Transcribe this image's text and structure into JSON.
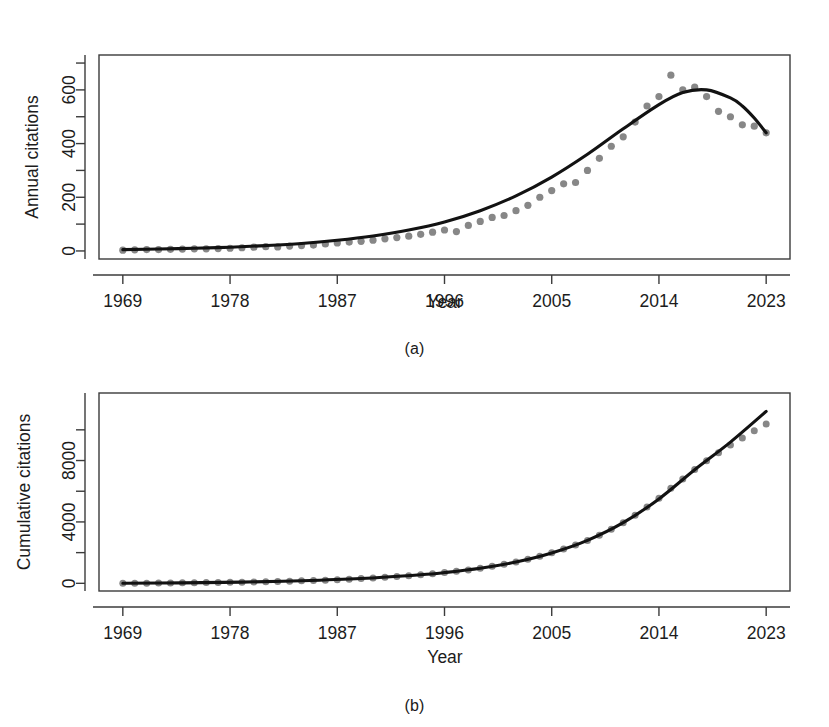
{
  "figure": {
    "panels": [
      {
        "id": "a",
        "caption": "(a)",
        "xlabel": "Year",
        "ylabel": "Annual citations"
      },
      {
        "id": "b",
        "caption": "(b)",
        "xlabel": "Year",
        "ylabel": "Cumulative citations"
      }
    ]
  },
  "chart_data": [
    {
      "type": "scatter",
      "panel": "a",
      "title": "",
      "xlabel": "Year",
      "ylabel": "Annual citations",
      "xlim": [
        1967,
        2025
      ],
      "ylim": [
        -30,
        730
      ],
      "xticks": [
        1969,
        1978,
        1987,
        1996,
        2005,
        2014,
        2023
      ],
      "xtick_labels": [
        "1969",
        "1978",
        "1987",
        "1996",
        "2005",
        "2014",
        "2023"
      ],
      "yticks": [
        0,
        200,
        400,
        600
      ],
      "ytick_labels": [
        "0",
        "200",
        "400",
        "600"
      ],
      "yminor_ticks": [
        100,
        300,
        500,
        700
      ],
      "grid": false,
      "legend": "none",
      "series": [
        {
          "name": "Observed annual citations",
          "style": "points",
          "color": "#878787",
          "x": [
            1969,
            1970,
            1971,
            1972,
            1973,
            1974,
            1975,
            1976,
            1977,
            1978,
            1979,
            1980,
            1981,
            1982,
            1983,
            1984,
            1985,
            1986,
            1987,
            1988,
            1989,
            1990,
            1991,
            1992,
            1993,
            1994,
            1995,
            1996,
            1997,
            1998,
            1999,
            2000,
            2001,
            2002,
            2003,
            2004,
            2005,
            2006,
            2007,
            2008,
            2009,
            2010,
            2011,
            2012,
            2013,
            2014,
            2015,
            2016,
            2017,
            2018,
            2019,
            2020,
            2021,
            2022,
            2023
          ],
          "y": [
            3,
            4,
            5,
            5,
            6,
            7,
            8,
            8,
            9,
            10,
            12,
            14,
            16,
            15,
            18,
            20,
            22,
            26,
            30,
            33,
            36,
            40,
            45,
            50,
            55,
            62,
            70,
            78,
            72,
            95,
            110,
            125,
            132,
            150,
            170,
            200,
            225,
            250,
            255,
            300,
            345,
            390,
            425,
            480,
            540,
            575,
            655,
            600,
            610,
            575,
            520,
            500,
            470,
            465,
            440
          ]
        },
        {
          "name": "Fitted curve",
          "style": "line",
          "color": "#121212",
          "x": [
            1969,
            1972,
            1975,
            1978,
            1981,
            1984,
            1987,
            1990,
            1993,
            1996,
            1999,
            2002,
            2005,
            2008,
            2011,
            2014,
            2016,
            2018,
            2020,
            2021,
            2022,
            2023
          ],
          "y": [
            5,
            7,
            10,
            14,
            20,
            28,
            40,
            56,
            78,
            108,
            150,
            205,
            275,
            360,
            455,
            545,
            590,
            600,
            570,
            540,
            495,
            440
          ]
        }
      ]
    },
    {
      "type": "scatter",
      "panel": "b",
      "title": "",
      "xlabel": "Year",
      "ylabel": "Cumulative citations",
      "xlim": [
        1967,
        2025
      ],
      "ylim": [
        -500,
        12400
      ],
      "xticks": [
        1969,
        1978,
        1987,
        1996,
        2005,
        2014,
        2023
      ],
      "xtick_labels": [
        "1969",
        "1978",
        "1987",
        "1996",
        "2005",
        "2014",
        "2023"
      ],
      "yticks": [
        0,
        4000,
        8000
      ],
      "ytick_labels": [
        "0",
        "4000",
        "8000"
      ],
      "yminor_ticks": [
        2000,
        6000,
        10000
      ],
      "grid": false,
      "legend": "none",
      "series": [
        {
          "name": "Observed cumulative citations",
          "style": "points",
          "color": "#878787",
          "x": [
            1969,
            1970,
            1971,
            1972,
            1973,
            1974,
            1975,
            1976,
            1977,
            1978,
            1979,
            1980,
            1981,
            1982,
            1983,
            1984,
            1985,
            1986,
            1987,
            1988,
            1989,
            1990,
            1991,
            1992,
            1993,
            1994,
            1995,
            1996,
            1997,
            1998,
            1999,
            2000,
            2001,
            2002,
            2003,
            2004,
            2005,
            2006,
            2007,
            2008,
            2009,
            2010,
            2011,
            2012,
            2013,
            2014,
            2015,
            2016,
            2017,
            2018,
            2019,
            2020,
            2021,
            2022,
            2023
          ],
          "y": [
            3,
            7,
            12,
            17,
            23,
            30,
            38,
            46,
            55,
            65,
            77,
            91,
            107,
            122,
            140,
            160,
            182,
            208,
            238,
            271,
            307,
            347,
            392,
            442,
            497,
            559,
            629,
            707,
            779,
            874,
            984,
            1109,
            1241,
            1391,
            1561,
            1761,
            1986,
            2236,
            2491,
            2791,
            3136,
            3526,
            3951,
            4431,
            4971,
            5546,
            6201,
            6801,
            7411,
            7986,
            8506,
            9006,
            9476,
            9941,
            10381
          ]
        },
        {
          "name": "Fitted curve",
          "style": "line",
          "color": "#121212",
          "x": [
            1969,
            1974,
            1979,
            1984,
            1989,
            1994,
            1996,
            1999,
            2002,
            2005,
            2008,
            2011,
            2014,
            2017,
            2020,
            2023
          ],
          "y": [
            5,
            32,
            80,
            165,
            310,
            560,
            700,
            980,
            1390,
            1980,
            2800,
            3950,
            5500,
            7400,
            9200,
            11200
          ]
        }
      ]
    }
  ]
}
